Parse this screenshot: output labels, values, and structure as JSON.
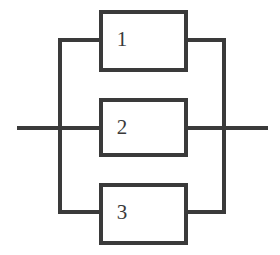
{
  "diagram": {
    "type": "reliability-block-diagram",
    "configuration": "parallel",
    "title": "",
    "background_color": "#ffffff",
    "stroke_color": "#3a3a3a",
    "stroke_width": 4,
    "canvas": {
      "width": 280,
      "height": 255
    },
    "blocks": [
      {
        "id": "block-1",
        "label": "1",
        "x": 101,
        "y": 12,
        "width": 85,
        "height": 58,
        "branch_y": 40
      },
      {
        "id": "block-2",
        "label": "2",
        "x": 101,
        "y": 100,
        "width": 85,
        "height": 55,
        "branch_y": 128
      },
      {
        "id": "block-3",
        "label": "3",
        "x": 101,
        "y": 185,
        "width": 85,
        "height": 58,
        "branch_y": 212
      }
    ],
    "wires": {
      "input_lead": {
        "x1": 17,
        "y1": 128,
        "x2": 60,
        "y2": 128
      },
      "output_lead": {
        "x1": 224,
        "y1": 128,
        "x2": 268,
        "y2": 128
      },
      "left_bus": {
        "x": 60,
        "y1": 40,
        "y2": 212
      },
      "right_bus": {
        "x": 224,
        "y1": 40,
        "y2": 212
      },
      "branches": [
        {
          "name": "branch-1-in",
          "x1": 60,
          "y1": 40,
          "x2": 101,
          "y2": 40
        },
        {
          "name": "branch-1-out",
          "x1": 186,
          "y1": 40,
          "x2": 224,
          "y2": 40
        },
        {
          "name": "branch-2-in",
          "x1": 60,
          "y1": 128,
          "x2": 101,
          "y2": 128
        },
        {
          "name": "branch-2-out",
          "x1": 186,
          "y1": 128,
          "x2": 224,
          "y2": 128
        },
        {
          "name": "branch-3-in",
          "x1": 60,
          "y1": 212,
          "x2": 101,
          "y2": 212
        },
        {
          "name": "branch-3-out",
          "x1": 186,
          "y1": 212,
          "x2": 224,
          "y2": 212
        }
      ]
    }
  }
}
